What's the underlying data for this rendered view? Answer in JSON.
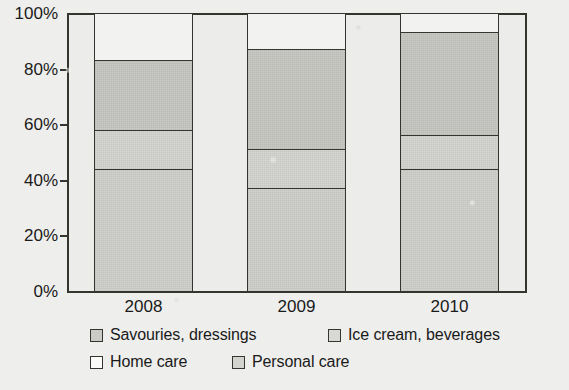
{
  "title_remnant": "",
  "chart_data": {
    "type": "bar",
    "subtype": "stacked-percentage-column",
    "title": "",
    "xlabel": "",
    "ylabel": "",
    "ylim": [
      0,
      100
    ],
    "y_unit": "%",
    "grid": false,
    "legend_position": "bottom",
    "categories": [
      "2008",
      "2009",
      "2010"
    ],
    "y_ticks": [
      "0%",
      "20%",
      "40%",
      "60%",
      "80%",
      "100%"
    ],
    "y_tick_values": [
      0,
      20,
      40,
      60,
      80,
      100
    ],
    "series": [
      {
        "name": "Savouries, dressings",
        "swatch": "sw-sav",
        "fill": "fill-sav",
        "color": "#c9c9c5",
        "values": [
          25,
          36,
          37
        ]
      },
      {
        "name": "Ice cream, beverages",
        "swatch": "sw-ice",
        "fill": "fill-ice",
        "color": "#d7d7d4",
        "values": [
          14,
          14,
          12
        ]
      },
      {
        "name": "Home care",
        "swatch": "sw-home",
        "fill": "fill-home",
        "color": "#f2f2f0",
        "values": [
          17,
          13,
          7
        ]
      },
      {
        "name": "Personal care",
        "swatch": "sw-personal",
        "fill": "fill-personal",
        "color": "#d2d2cf",
        "values": [
          44,
          37,
          44
        ]
      }
    ],
    "stack_order_bottom_to_top": [
      "Personal care",
      "Ice cream, beverages",
      "Savouries, dressings",
      "Home care"
    ],
    "cumulative_boundaries_percent": {
      "2008": [
        44,
        58,
        83,
        100
      ],
      "2009": [
        37,
        51,
        87,
        100
      ],
      "2010": [
        44,
        56,
        93,
        100
      ]
    }
  },
  "legend": {
    "rows": [
      [
        {
          "label": "Savouries, dressings",
          "swatch": "sw-sav",
          "left": 90,
          "name": "legend-savouries-dressings"
        },
        {
          "label": "Ice cream, beverages",
          "swatch": "sw-ice",
          "left": 328,
          "name": "legend-ice-cream-beverages"
        }
      ],
      [
        {
          "label": "Home care",
          "swatch": "sw-home",
          "left": 90,
          "name": "legend-home-care"
        },
        {
          "label": "Personal care",
          "swatch": "sw-personal",
          "left": 232,
          "name": "legend-personal-care"
        }
      ]
    ]
  },
  "layout": {
    "plot": {
      "left": 67,
      "top": 13,
      "width": 460,
      "height": 280
    },
    "bars": [
      {
        "category": "2008",
        "column_left": 67,
        "column_width": 153,
        "bar_left": 27,
        "bar_width": 99
      },
      {
        "category": "2009",
        "column_left": 220,
        "column_width": 153,
        "bar_left": 27,
        "bar_width": 99
      },
      {
        "category": "2010",
        "column_left": 373,
        "column_width": 153,
        "bar_left": 27,
        "bar_width": 99
      }
    ]
  },
  "colors": {
    "page_background": "#eeeeec",
    "plot_background": "#ececeb",
    "ink": "#35352f"
  }
}
